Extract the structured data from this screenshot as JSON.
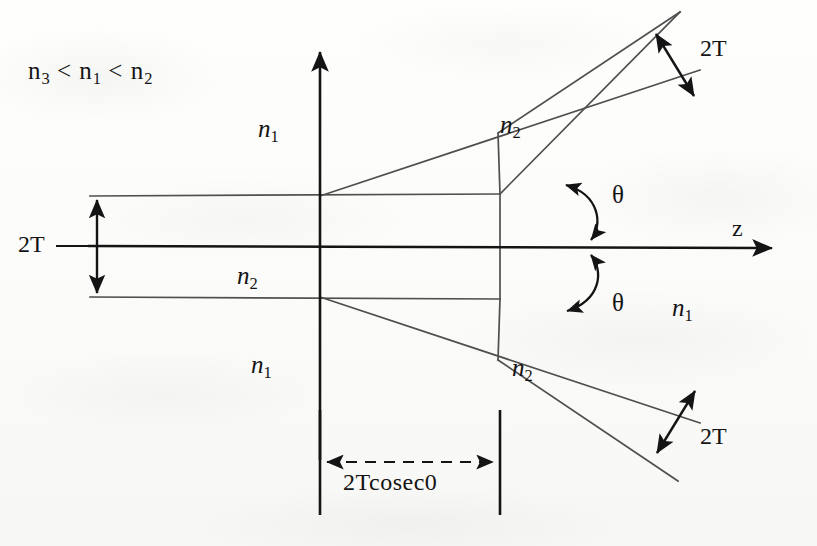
{
  "figure": {
    "type": "technical-diagram",
    "background_color": "#fdfdfb",
    "line_color": "#141414",
    "guide_line_color": "#5a5a5a"
  },
  "labels": {
    "inequality": "n₃ < n₁ < n₂",
    "inequality_parts": {
      "a": "n",
      "a_sub": "3",
      "op1": "<",
      "b": "n",
      "b_sub": "1",
      "op2": "<",
      "c": "n",
      "c_sub": "2"
    },
    "index_n1": "n",
    "index_n1_sub": "1",
    "index_n2": "n",
    "index_n2_sub": "2",
    "thickness_left": "2T",
    "thickness_upper_branch": "2T",
    "thickness_lower_branch": "2T",
    "angle_upper": "θ",
    "angle_lower": "θ",
    "axis_z": "z",
    "taper_length": "2Tcosec0"
  },
  "geometry": {
    "origin": {
      "x": 320,
      "y": 246
    },
    "z_axis": {
      "x1": 88,
      "y1": 246,
      "x2": 780,
      "y2": 248,
      "arrow": "right"
    },
    "y_axis": {
      "x1": 320,
      "y1": 460,
      "x2": 320,
      "y2": 45,
      "arrow": "up"
    },
    "slab_half_thickness_px": 50,
    "slab_top_wall_y": 196,
    "slab_bottom_wall_y": 297,
    "slab_left_x": 90,
    "junction_right_x": 500,
    "branch_angle_deg": 26,
    "taper_left_tick_x": 320,
    "taper_right_tick_x": 500,
    "taper_tick_top_y": 410,
    "taper_tick_bottom_y": 515,
    "taper_arrow_y": 462
  },
  "annotations": {
    "dimension_arrows": [
      {
        "name": "left-thickness",
        "label": "2T",
        "orientation": "vertical",
        "x": 97,
        "y1": 196,
        "y2": 297
      },
      {
        "name": "upper-branch-thickness",
        "label": "2T",
        "orientation": "perpendicular",
        "x1": 655,
        "y1": 33,
        "x2": 694,
        "y2": 96
      },
      {
        "name": "lower-branch-thickness",
        "label": "2T",
        "orientation": "perpendicular",
        "x1": 657,
        "y1": 455,
        "x2": 696,
        "y2": 392
      },
      {
        "name": "taper-length",
        "label": "2Tcosec0",
        "orientation": "horizontal-dashed",
        "x1": 320,
        "x2": 500,
        "y": 462
      }
    ],
    "angle_arcs": [
      {
        "name": "theta-upper",
        "label": "θ",
        "from": "z-axis",
        "to": "upper-branch-lower-edge"
      },
      {
        "name": "theta-lower",
        "label": "θ",
        "from": "z-axis",
        "to": "lower-branch-upper-edge"
      }
    ]
  }
}
